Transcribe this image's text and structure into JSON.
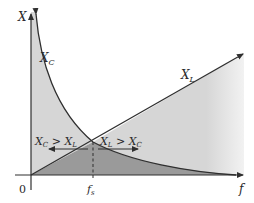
{
  "diagram": {
    "y_axis_label": "X",
    "x_axis_label": "f",
    "origin_label": "0",
    "resonance_label": "f",
    "resonance_subscript": "s",
    "curves": [
      {
        "name": "X_C",
        "label_main": "X",
        "label_sub": "C",
        "shape": "hyperbola decreasing"
      },
      {
        "name": "X_L",
        "label_main": "X",
        "label_sub": "L",
        "shape": "straight line increasing"
      }
    ],
    "regions": [
      {
        "label_left": "X",
        "sub_left": "C",
        "op": ">",
        "label_right": "X",
        "sub_right": "L",
        "direction": "left"
      },
      {
        "label_left": "X",
        "sub_left": "L",
        "op": ">",
        "label_right": "X",
        "sub_right": "C",
        "direction": "right"
      }
    ],
    "colors": {
      "light_fill": "#d6d6d6",
      "dark_fill": "#9a9a9a",
      "line": "#2f2f2f"
    }
  }
}
